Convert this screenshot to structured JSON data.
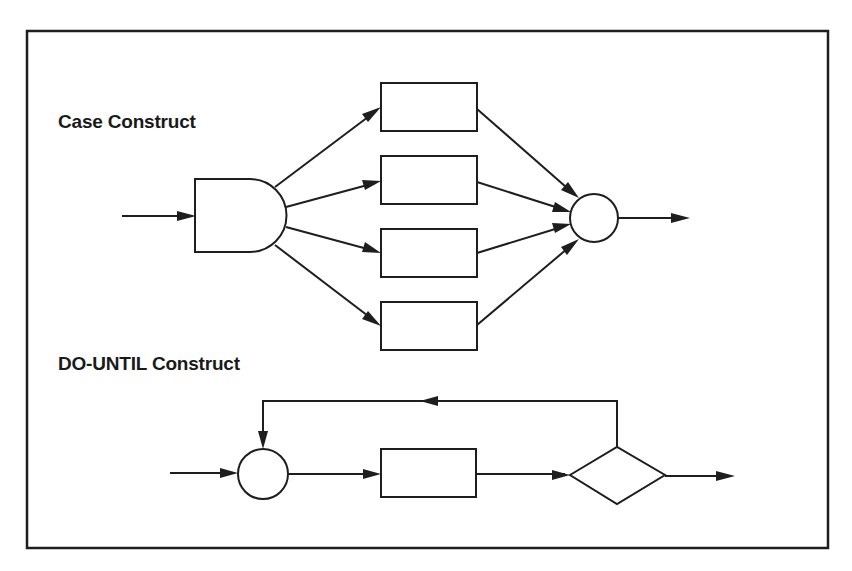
{
  "diagram": {
    "colors": {
      "ink": "#1e1e1e",
      "background": "#ffffff"
    },
    "sections": [
      {
        "id": "case",
        "title": "Case Construct",
        "nodes": [
          {
            "id": "selector",
            "type": "selector-gate",
            "label": ""
          },
          {
            "id": "case-box-1",
            "type": "process-box",
            "label": ""
          },
          {
            "id": "case-box-2",
            "type": "process-box",
            "label": ""
          },
          {
            "id": "case-box-3",
            "type": "process-box",
            "label": ""
          },
          {
            "id": "case-box-4",
            "type": "process-box",
            "label": ""
          },
          {
            "id": "case-junction",
            "type": "junction-circle",
            "label": ""
          }
        ],
        "edges": [
          {
            "from": "input",
            "to": "selector"
          },
          {
            "from": "selector",
            "to": "case-box-1"
          },
          {
            "from": "selector",
            "to": "case-box-2"
          },
          {
            "from": "selector",
            "to": "case-box-3"
          },
          {
            "from": "selector",
            "to": "case-box-4"
          },
          {
            "from": "case-box-1",
            "to": "case-junction"
          },
          {
            "from": "case-box-2",
            "to": "case-junction"
          },
          {
            "from": "case-box-3",
            "to": "case-junction"
          },
          {
            "from": "case-box-4",
            "to": "case-junction"
          },
          {
            "from": "case-junction",
            "to": "output"
          }
        ]
      },
      {
        "id": "do-until",
        "title": "DO-UNTIL Construct",
        "nodes": [
          {
            "id": "loop-junction",
            "type": "junction-circle",
            "label": ""
          },
          {
            "id": "loop-box",
            "type": "process-box",
            "label": ""
          },
          {
            "id": "loop-decision",
            "type": "decision-diamond",
            "label": ""
          }
        ],
        "edges": [
          {
            "from": "input",
            "to": "loop-junction"
          },
          {
            "from": "loop-junction",
            "to": "loop-box"
          },
          {
            "from": "loop-box",
            "to": "loop-decision"
          },
          {
            "from": "loop-decision",
            "to": "loop-junction",
            "route": "feedback-over-top"
          },
          {
            "from": "loop-decision",
            "to": "output"
          }
        ]
      }
    ]
  }
}
